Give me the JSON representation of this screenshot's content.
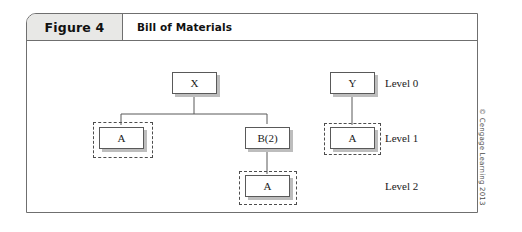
{
  "figure": {
    "number_label": "Figure 4",
    "title": "Bill of Materials"
  },
  "credit": "© Cengage Learning 2013",
  "diagram": {
    "type": "bill-of-materials-tree",
    "nodes": [
      {
        "id": "x",
        "label": "X",
        "level": 0,
        "tree": "left",
        "highlighted": false
      },
      {
        "id": "a-left",
        "label": "A",
        "level": 1,
        "tree": "left",
        "highlighted": true
      },
      {
        "id": "b2",
        "label": "B(2)",
        "level": 1,
        "tree": "left",
        "highlighted": false
      },
      {
        "id": "a-under-b",
        "label": "A",
        "level": 2,
        "tree": "left",
        "highlighted": true
      },
      {
        "id": "y",
        "label": "Y",
        "level": 0,
        "tree": "right",
        "highlighted": false
      },
      {
        "id": "a-right",
        "label": "A",
        "level": 1,
        "tree": "right",
        "highlighted": true
      }
    ],
    "edges": [
      {
        "from": "x",
        "to": "a-left"
      },
      {
        "from": "x",
        "to": "b2"
      },
      {
        "from": "b2",
        "to": "a-under-b"
      },
      {
        "from": "y",
        "to": "a-right"
      }
    ],
    "level_labels": [
      {
        "id": "level-0",
        "text": "Level 0"
      },
      {
        "id": "level-1",
        "text": "Level 1"
      },
      {
        "id": "level-2",
        "text": "Level 2"
      }
    ]
  }
}
